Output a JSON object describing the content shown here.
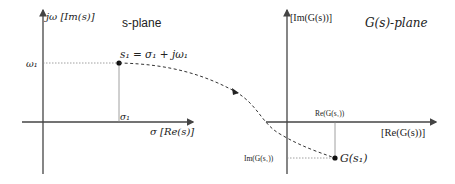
{
  "left_plane": {
    "title": "s-plane",
    "y_axis_label": "jω [Im(s)]",
    "x_axis_label": "σ [Re(s)]",
    "tick_y": "ω₁",
    "tick_x": "σ₁",
    "point_label": "s₁ = σ₁ + jω₁"
  },
  "right_plane": {
    "title": "G(s)-plane",
    "y_axis_label": "[Im(G(s))]",
    "x_axis_label": "[Re(G(s))]",
    "tick_x": "Re(G(s₁))",
    "tick_y": "Im(G(s₁))",
    "point_label": "G(s₁)"
  },
  "colors": {
    "axis": "#444444",
    "curve": "#333333",
    "guide": "#888888"
  }
}
